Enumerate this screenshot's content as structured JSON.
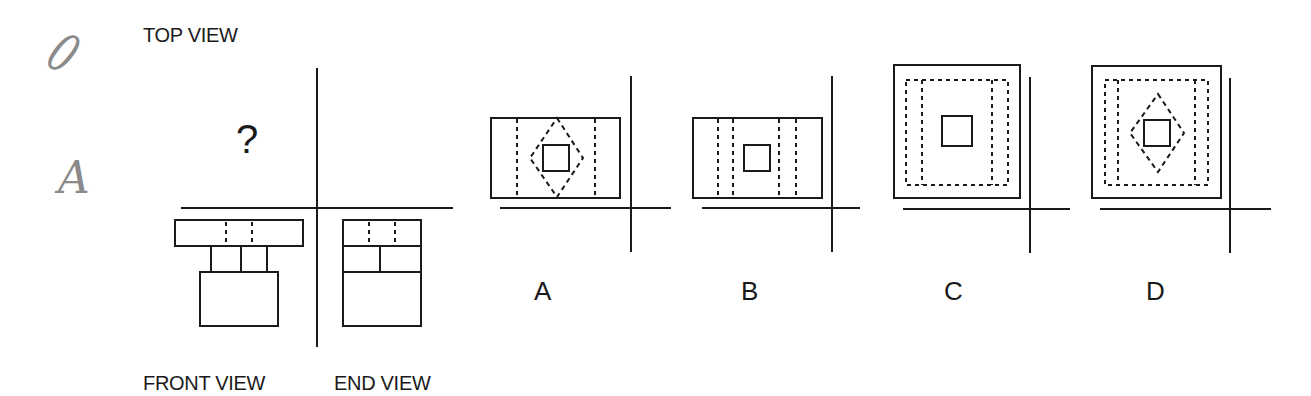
{
  "handwriting": {
    "mark1": "0",
    "mark2": "A"
  },
  "labels": {
    "top_view": "TOP VIEW",
    "front_view": "FRONT VIEW",
    "end_view": "END VIEW",
    "question_mark": "?"
  },
  "options": [
    {
      "id": "A",
      "label": "A"
    },
    {
      "id": "B",
      "label": "B"
    },
    {
      "id": "C",
      "label": "C"
    },
    {
      "id": "D",
      "label": "D"
    }
  ],
  "colors": {
    "ink": "#1a1a1a",
    "pencil": "#8a8a8a",
    "background": "#ffffff"
  }
}
